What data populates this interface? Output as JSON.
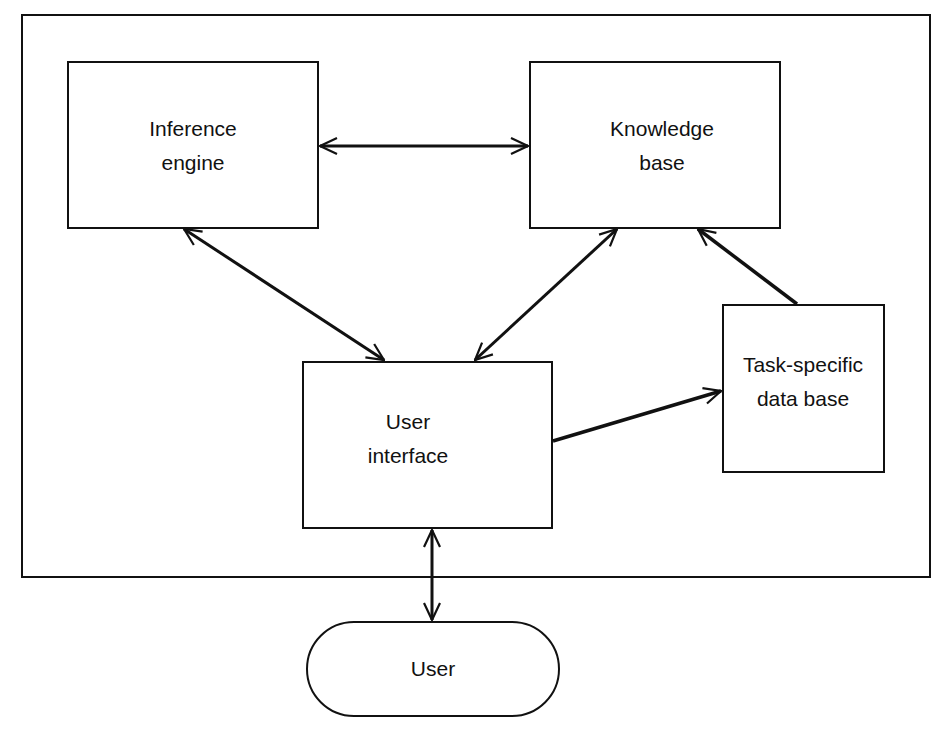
{
  "diagram": {
    "type": "block-diagram",
    "nodes": {
      "inference_engine": {
        "line1": "Inference",
        "line2": "engine"
      },
      "knowledge_base": {
        "line1": "Knowledge",
        "line2": "base"
      },
      "user_interface": {
        "line1": "User",
        "line2": "interface"
      },
      "task_db": {
        "line1": "Task-specific",
        "line2": "data base"
      },
      "user": {
        "label": "User"
      }
    },
    "edges": [
      {
        "from": "Inference engine",
        "to": "Knowledge base",
        "direction": "bidirectional"
      },
      {
        "from": "Inference engine",
        "to": "User interface",
        "direction": "bidirectional"
      },
      {
        "from": "Knowledge base",
        "to": "User interface",
        "direction": "bidirectional"
      },
      {
        "from": "User interface",
        "to": "Task-specific data base",
        "direction": "forward"
      },
      {
        "from": "Task-specific data base",
        "to": "Knowledge base",
        "direction": "forward"
      },
      {
        "from": "User interface",
        "to": "User",
        "direction": "bidirectional"
      }
    ],
    "colors": {
      "stroke": "#111111",
      "background": "#ffffff"
    }
  }
}
